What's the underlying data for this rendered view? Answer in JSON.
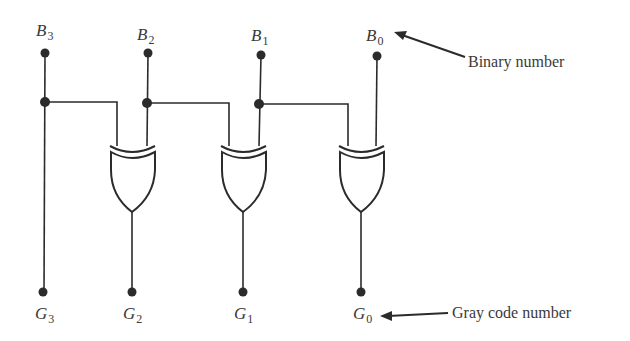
{
  "diagram": {
    "inputs": [
      {
        "letter": "B",
        "index": "3"
      },
      {
        "letter": "B",
        "index": "2"
      },
      {
        "letter": "B",
        "index": "1"
      },
      {
        "letter": "B",
        "index": "0"
      }
    ],
    "outputs": [
      {
        "letter": "G",
        "index": "3"
      },
      {
        "letter": "G",
        "index": "2"
      },
      {
        "letter": "G",
        "index": "1"
      },
      {
        "letter": "G",
        "index": "0"
      }
    ],
    "gates": [
      {
        "type": "XOR",
        "inputs": [
          "B3",
          "B2"
        ],
        "output": "G2"
      },
      {
        "type": "XOR",
        "inputs": [
          "B2",
          "B1"
        ],
        "output": "G1"
      },
      {
        "type": "XOR",
        "inputs": [
          "B1",
          "B0"
        ],
        "output": "G0"
      }
    ],
    "annotations": {
      "binary": "Binary number",
      "gray": "Gray code number"
    },
    "colors": {
      "line": "#2b2b2b",
      "text": "#3a3a3a",
      "background": "#ffffff"
    }
  }
}
